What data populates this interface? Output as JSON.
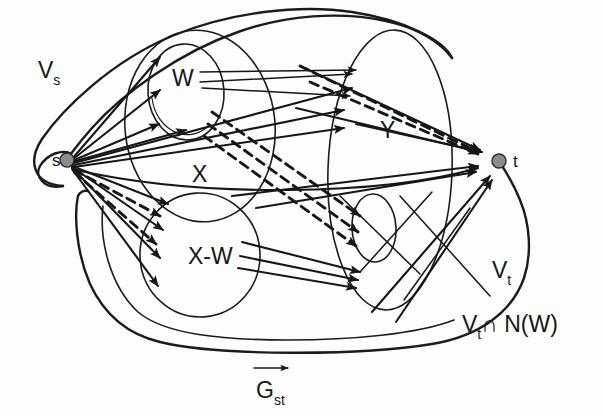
{
  "figure": {
    "background_color": "#fdfdfd",
    "ink_color": "#161616",
    "node_fill_color": "#8c8c8c"
  },
  "labels": {
    "vs": "V",
    "vs_sub": "s",
    "vt": "V",
    "vt_sub": "t",
    "w": "W",
    "x": "X",
    "y": "Y",
    "x_minus_w": "X-W",
    "vt_cap_nw": "V ∩ N(W)",
    "vt_cap_nw_sub": "t",
    "vt_cap_nw_head": "V",
    "vt_cap_nw_tail": "∩ N(W)",
    "g_st": "G",
    "g_st_sub": "st",
    "node_s": "s",
    "node_t": "t"
  },
  "nodes": [
    {
      "id": "s",
      "label": "s",
      "cx": 67,
      "cy": 160,
      "r": 7
    },
    {
      "id": "t",
      "label": "t",
      "cx": 499,
      "cy": 161,
      "r": 7
    }
  ],
  "regions": [
    {
      "id": "vs",
      "label": "V_s",
      "label_x": 47,
      "label_y": 72
    },
    {
      "id": "vt",
      "label": "V_t",
      "label_x": 497,
      "label_y": 272
    },
    {
      "id": "x",
      "label": "X",
      "label_x": 196,
      "label_y": 176
    },
    {
      "id": "w",
      "label": "W",
      "label_x": 177,
      "label_y": 82
    },
    {
      "id": "x_minus_w",
      "label": "X-W",
      "label_x": 192,
      "label_y": 258
    },
    {
      "id": "y",
      "label": "Y",
      "label_x": 389,
      "label_y": 132
    },
    {
      "id": "vt_cap_nw",
      "label": "V_t ∩ N(W)",
      "label_x": 466,
      "label_y": 329
    }
  ],
  "caption": {
    "text": "G_st",
    "x": 262,
    "y": 393,
    "has_overset_arrow": true
  },
  "edge_styles": {
    "solid": "solid",
    "dashed": "dashed"
  }
}
